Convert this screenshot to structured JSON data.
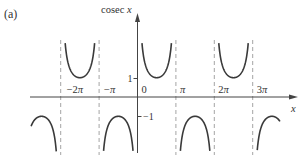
{
  "panel_label": "(a)",
  "chart_data": {
    "type": "line",
    "title": "",
    "function": "cosec x",
    "xlabel": "x",
    "ylabel": "cosec x",
    "x_ticks": [
      {
        "value": -6.2832,
        "label": "−2π"
      },
      {
        "value": -3.1416,
        "label": "−π"
      },
      {
        "value": 0,
        "label": "0"
      },
      {
        "value": 3.1416,
        "label": "π"
      },
      {
        "value": 6.2832,
        "label": "2π"
      },
      {
        "value": 9.4248,
        "label": "3π"
      }
    ],
    "y_ticks": [
      {
        "value": 1,
        "label": "1"
      },
      {
        "value": -1,
        "label": "−1"
      }
    ],
    "asymptotes_x": [
      "−2π",
      "−π",
      "0",
      "π",
      "2π",
      "3π"
    ],
    "xlim_pi": [
      -2.77,
      3.71
    ],
    "ylim": [
      -2.85,
      2.85
    ],
    "grid": false,
    "legend": null,
    "branches": [
      {
        "x_range_pi": [
          -2.77,
          -2.0
        ],
        "sign": "negative",
        "extremum": {
          "x": "−5π/2",
          "y": -1
        }
      },
      {
        "x_range_pi": [
          -2.0,
          -1.0
        ],
        "sign": "positive",
        "extremum": {
          "x": "−3π/2",
          "y": 1
        }
      },
      {
        "x_range_pi": [
          -1.0,
          0.0
        ],
        "sign": "negative",
        "extremum": {
          "x": "−π/2",
          "y": -1
        }
      },
      {
        "x_range_pi": [
          0.0,
          1.0
        ],
        "sign": "positive",
        "extremum": {
          "x": "π/2",
          "y": 1
        }
      },
      {
        "x_range_pi": [
          1.0,
          2.0
        ],
        "sign": "negative",
        "extremum": {
          "x": "3π/2",
          "y": -1
        }
      },
      {
        "x_range_pi": [
          2.0,
          3.0
        ],
        "sign": "positive",
        "extremum": {
          "x": "5π/2",
          "y": 1
        }
      },
      {
        "x_range_pi": [
          3.0,
          3.71
        ],
        "sign": "negative",
        "extremum": {
          "x": "7π/2",
          "y": -1
        }
      }
    ],
    "colors": {
      "curve": "#3a3a3a",
      "axis": "#444444",
      "asymptote": "#9a9a9a",
      "text": "#333333"
    }
  }
}
